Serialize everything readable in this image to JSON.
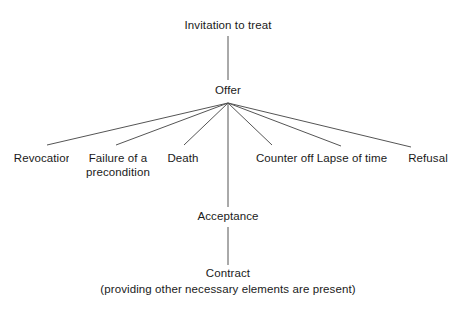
{
  "diagram": {
    "background_color": "#ffffff",
    "line_color": "#555555",
    "text_color": "#1a1a1a",
    "nodes": {
      "invitation": {
        "label": "Invitation to treat",
        "x": 228,
        "y": 26
      },
      "offer": {
        "label": "Offer",
        "x": 228,
        "y": 91
      },
      "acceptance": {
        "label": "Acceptance",
        "x": 228,
        "y": 217
      },
      "contract": {
        "label": "Contract",
        "x": 228,
        "y": 274
      },
      "contract_note": {
        "label": "(providing other necessary elements are present)",
        "x": 228,
        "y": 290
      }
    },
    "termination_branches": [
      {
        "label": "Revocation",
        "x": 43,
        "y": 159,
        "line_end_x": 47,
        "line_end_y": 145
      },
      {
        "label": "Failure of a\npreconditon",
        "label_line1": "Failure of a",
        "label_line2": "precondition",
        "x": 118,
        "y": 159,
        "line_end_x": 116,
        "line_end_y": 145
      },
      {
        "label": "Death",
        "x": 183,
        "y": 159,
        "line_end_x": 184,
        "line_end_y": 145
      },
      {
        "label": "Counter offer",
        "x": 290,
        "y": 159,
        "line_end_x": 272,
        "line_end_y": 145
      },
      {
        "label": "Lapse of time",
        "x": 352,
        "y": 159,
        "line_end_x": 341,
        "line_end_y": 146
      },
      {
        "label": "Refusal",
        "x": 428,
        "y": 159,
        "line_end_x": 411,
        "line_end_y": 147
      }
    ],
    "connectors": [
      {
        "name": "invitation-to-offer",
        "x1": 228,
        "y1": 36,
        "x2": 228,
        "y2": 80
      },
      {
        "name": "offer-to-acceptance",
        "x1": 228,
        "y1": 103,
        "x2": 228,
        "y2": 207
      },
      {
        "name": "acceptance-to-contract",
        "x1": 228,
        "y1": 227,
        "x2": 228,
        "y2": 265
      }
    ],
    "fan_origin": {
      "x": 228,
      "y": 103
    }
  }
}
